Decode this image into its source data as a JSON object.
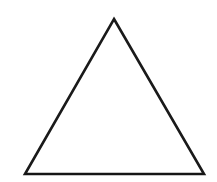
{
  "figure": {
    "name": "triangle",
    "type": "line-drawing",
    "background_color": "#ffffff",
    "stroke_color": "#1a1a1a",
    "stroke_width": 2.6,
    "fill": "none",
    "canvas": {
      "width": 217,
      "height": 182
    },
    "vertices": [
      {
        "label": "apex",
        "x": 114,
        "y": 19
      },
      {
        "label": "bottom-right",
        "x": 204,
        "y": 174
      },
      {
        "label": "bottom-left",
        "x": 25,
        "y": 174
      }
    ],
    "edges": [
      {
        "label": "left-edge",
        "from": "bottom-left",
        "to": "apex"
      },
      {
        "label": "right-edge",
        "from": "apex",
        "to": "bottom-right"
      },
      {
        "label": "base-edge",
        "from": "bottom-right",
        "to": "bottom-left"
      }
    ],
    "points_path": "114,19 204,174 25,174",
    "baseline_path": "M25,174 L204,174",
    "labels": []
  }
}
